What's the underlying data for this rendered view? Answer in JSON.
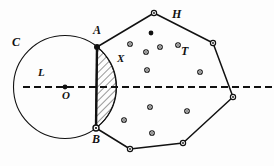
{
  "figure": {
    "background_color": "#fdfdfd",
    "stroke_color": "#111111",
    "width": 274,
    "height": 166,
    "labels": {
      "circle": "C",
      "line": "L",
      "center": "O",
      "intersection_top": "A",
      "intersection_bottom": "B",
      "lens_region": "X",
      "polygon": "H",
      "point_set": "T"
    },
    "label_positions": {
      "circle": {
        "x": 12,
        "y": 42
      },
      "line": {
        "x": 38,
        "y": 73
      },
      "center": {
        "x": 62,
        "y": 94
      },
      "intersection_top": {
        "x": 93,
        "y": 29
      },
      "intersection_bottom": {
        "x": 92,
        "y": 138
      },
      "lens_region": {
        "x": 117,
        "y": 58
      },
      "polygon": {
        "x": 172,
        "y": 13
      },
      "point_set": {
        "x": 181,
        "y": 50
      }
    },
    "circle": {
      "name": "C",
      "center": {
        "x": 65,
        "y": 87
      },
      "radius": 51.5,
      "stroke_width": 1.1
    },
    "line": {
      "name": "L",
      "y": 87,
      "x_start": 23,
      "x_end": 272,
      "dash": "7,4",
      "stroke_width": 2
    },
    "chord": {
      "from": "A",
      "to": "B",
      "a": {
        "x": 97,
        "y": 47
      },
      "b": {
        "x": 96,
        "y": 128
      },
      "stroke_width": 2.2
    },
    "lens": {
      "name": "X",
      "fill": "hatch-45",
      "hatch_spacing": 4,
      "hatch_stroke_width": 0.9
    },
    "polygon": {
      "name": "H",
      "vertices": [
        {
          "x": 97,
          "y": 47
        },
        {
          "x": 154,
          "y": 13
        },
        {
          "x": 213,
          "y": 43
        },
        {
          "x": 233,
          "y": 97
        },
        {
          "x": 183,
          "y": 143
        },
        {
          "x": 130,
          "y": 149
        },
        {
          "x": 96,
          "y": 128
        }
      ],
      "stroke_width": 1.5,
      "vertex_marker": "open-circle",
      "vertex_radius": 2.6
    },
    "interior_points": [
      {
        "x": 151,
        "y": 33,
        "style": "filled"
      },
      {
        "x": 130,
        "y": 44,
        "style": "open"
      },
      {
        "x": 160,
        "y": 47,
        "style": "open"
      },
      {
        "x": 178,
        "y": 45,
        "style": "open"
      },
      {
        "x": 146,
        "y": 52,
        "style": "open"
      },
      {
        "x": 147,
        "y": 70,
        "style": "open"
      },
      {
        "x": 200,
        "y": 72,
        "style": "open"
      },
      {
        "x": 150,
        "y": 107,
        "style": "open"
      },
      {
        "x": 187,
        "y": 111,
        "style": "open"
      },
      {
        "x": 124,
        "y": 120,
        "style": "open"
      },
      {
        "x": 152,
        "y": 133,
        "style": "open"
      }
    ],
    "endpoint_markers": [
      {
        "x": 97,
        "y": 47,
        "style": "filled",
        "label": "A"
      },
      {
        "x": 96,
        "y": 128,
        "style": "open-filled",
        "label": "B"
      },
      {
        "x": 65,
        "y": 87,
        "style": "filled",
        "label": "O"
      }
    ]
  }
}
